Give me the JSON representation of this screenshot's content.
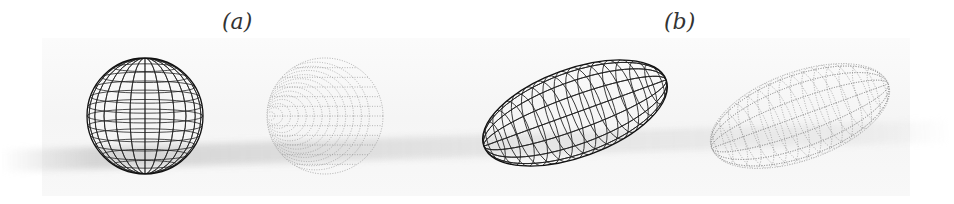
{
  "figure": {
    "panels": [
      {
        "label": "(a)",
        "description": "sphere wireframe and its dotted point-cloud counterpart"
      },
      {
        "label": "(b)",
        "description": "elongated ellipsoid wireframe and its dotted point-cloud counterpart"
      }
    ]
  }
}
